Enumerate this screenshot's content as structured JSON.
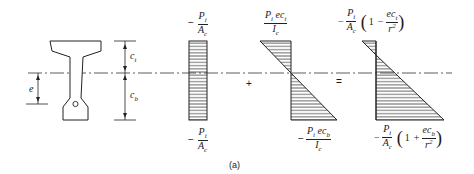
{
  "figure": {
    "caption": "(a)",
    "section": {
      "labels": {
        "c_t": "c",
        "c_t_sub": "t",
        "c_b": "c",
        "c_b_sub": "b",
        "e": "e"
      }
    },
    "operators": {
      "plus": "+",
      "equals": "="
    },
    "diagram1": {
      "top": {
        "sign": "−",
        "num": "P",
        "num_sub": "i",
        "den": "A",
        "den_sub": "c"
      },
      "bottom": {
        "sign": "−",
        "num": "P",
        "num_sub": "i",
        "den": "A",
        "den_sub": "c"
      }
    },
    "diagram2": {
      "top": {
        "num_a": "P",
        "num_sub": "i",
        "num_b": "ec",
        "num_sub2": "t",
        "den": "I",
        "den_sub": "c"
      },
      "bottom": {
        "sign": "−",
        "num_a": "P",
        "num_sub": "i",
        "num_b": "ec",
        "num_sub2": "b",
        "den": "I",
        "den_sub": "c"
      }
    },
    "diagram3": {
      "top": {
        "sign": "−",
        "num": "P",
        "num_sub": "i",
        "den": "A",
        "den_sub": "c",
        "one": "1",
        "op": "−",
        "inner_num": "ec",
        "inner_sub": "t",
        "inner_den": "r",
        "inner_exp": "2"
      },
      "bottom": {
        "sign": "−",
        "num": "P",
        "num_sub": "i",
        "den": "A",
        "den_sub": "c",
        "one": "1",
        "op": "+",
        "inner_num": "ec",
        "inner_sub": "b",
        "inner_den": "r",
        "inner_exp": "2"
      }
    }
  }
}
